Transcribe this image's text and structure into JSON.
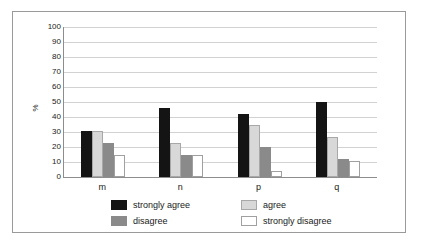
{
  "chart_data": {
    "type": "bar",
    "title": "",
    "subtitle": "",
    "xlabel": "",
    "ylabel": "%",
    "ylim": [
      0,
      100
    ],
    "ytick_step": 10,
    "yticks": [
      100,
      90,
      80,
      70,
      60,
      50,
      40,
      30,
      20,
      10,
      0
    ],
    "categories": [
      "m",
      "n",
      "p",
      "q"
    ],
    "grid": "horizontal",
    "legend_position": "bottom",
    "series": [
      {
        "name": "strongly agree",
        "color": "#141414",
        "values": [
          31,
          46,
          42,
          50
        ]
      },
      {
        "name": "agree",
        "color": "#d8d8d8",
        "values": [
          31,
          23,
          35,
          27
        ]
      },
      {
        "name": "disagree",
        "color": "#8a8a8a",
        "values": [
          23,
          15,
          20,
          12
        ]
      },
      {
        "name": "strongly disagree",
        "color": "#ffffff",
        "values": [
          15,
          15,
          4,
          11
        ]
      }
    ]
  },
  "legend": {
    "items": [
      {
        "label": "strongly agree"
      },
      {
        "label": "agree"
      },
      {
        "label": "disagree"
      },
      {
        "label": "strongly disagree"
      }
    ]
  },
  "axis": {
    "y_title": "%",
    "y_labels": [
      "100",
      "90",
      "80",
      "70",
      "60",
      "50",
      "40",
      "30",
      "20",
      "10",
      "0"
    ],
    "x_labels": [
      "m",
      "n",
      "p",
      "q"
    ]
  },
  "colors": {
    "strongly_agree": "#141414",
    "agree": "#d8d8d8",
    "disagree": "#8a8a8a",
    "strongly_disagree": "#ffffff",
    "gridline": "#d2d2d2",
    "axis": "#8d8d8d",
    "border": "#9a9a9a",
    "text": "#1a1a1a"
  }
}
